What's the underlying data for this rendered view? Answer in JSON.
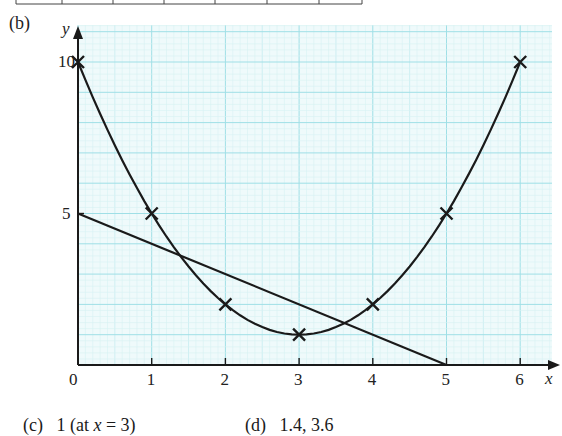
{
  "part_labels": {
    "b": "(b)",
    "c": "(c)",
    "d": "(d)"
  },
  "answers": {
    "c_value": "1 (at ",
    "c_var": "x",
    "c_rest": " = 3)",
    "d_value": "1.4, 3.6"
  },
  "colors": {
    "grid_major": "#9fdfe6",
    "grid_minor": "#d6f1f4",
    "grid_bg": "#effafb",
    "ink": "#1a1a1a"
  },
  "chart_data": {
    "type": "line",
    "title": "",
    "xlabel": "x",
    "ylabel": "y",
    "xlim": [
      0,
      6.3
    ],
    "ylim": [
      0,
      11.2
    ],
    "x_ticks": [
      "0",
      "1",
      "2",
      "3",
      "4",
      "5",
      "6"
    ],
    "y_ticks": [
      "5",
      "10"
    ],
    "grid": true,
    "series": [
      {
        "name": "curve y = x^2 - 6x + 10",
        "style": "smooth curve with x markers",
        "x": [
          0,
          1,
          2,
          3,
          4,
          5,
          6
        ],
        "y": [
          10,
          5,
          2,
          1,
          2,
          5,
          10
        ]
      },
      {
        "name": "line y = 5 - x",
        "style": "straight line",
        "x": [
          0,
          5
        ],
        "y": [
          5,
          0
        ]
      }
    ],
    "annotations": [
      {
        "text": "intersections at x ≈ 1.4 and x ≈ 3.6"
      },
      {
        "text": "minimum value 1 at x = 3"
      }
    ]
  }
}
